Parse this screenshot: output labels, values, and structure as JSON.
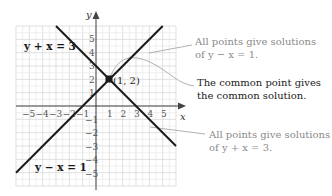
{
  "axes": {
    "x_label": "x",
    "y_label": "y",
    "x_ticks": [
      "−5",
      "−4",
      "−3",
      "−2",
      "−1",
      "1",
      "2",
      "3",
      "4",
      "5"
    ],
    "y_ticks": [
      "5",
      "4",
      "3",
      "2",
      "1",
      "−1",
      "−2",
      "−3",
      "−4",
      "−5"
    ]
  },
  "lines": [
    {
      "label": "y + x = 3",
      "from": [
        -3,
        6
      ],
      "to": [
        6,
        -3
      ]
    },
    {
      "label": "y − x = 1",
      "from": [
        -6,
        -5
      ],
      "to": [
        5,
        6
      ]
    }
  ],
  "intersection": {
    "label": "(1, 2)",
    "x": 1,
    "y": 2
  },
  "annotations": [
    {
      "line1": "All points give solutions",
      "line2": "of y − x = 1.",
      "tone": "gray"
    },
    {
      "line1": "The common point gives",
      "line2": "the common solution.",
      "tone": "dark"
    },
    {
      "line1": "All points give solutions",
      "line2": "of y + x = 3.",
      "tone": "gray"
    }
  ],
  "colors": {
    "line": "#1a1a1a",
    "grid": "#d2d2d2",
    "callout": "#a8a8a8",
    "gray_text": "#8a8a8a"
  }
}
